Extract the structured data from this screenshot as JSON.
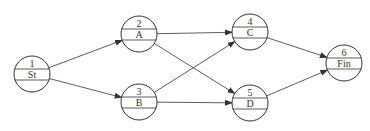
{
  "diagram": {
    "type": "activity-on-node network",
    "nodes": [
      {
        "id": "1",
        "label": "St"
      },
      {
        "id": "2",
        "label": "A"
      },
      {
        "id": "3",
        "label": "B"
      },
      {
        "id": "4",
        "label": "C"
      },
      {
        "id": "5",
        "label": "D"
      },
      {
        "id": "6",
        "label": "Fin"
      }
    ],
    "edges": [
      {
        "from": "1",
        "to": "2"
      },
      {
        "from": "1",
        "to": "3"
      },
      {
        "from": "2",
        "to": "4"
      },
      {
        "from": "2",
        "to": "5"
      },
      {
        "from": "3",
        "to": "4"
      },
      {
        "from": "3",
        "to": "5"
      },
      {
        "from": "4",
        "to": "6"
      },
      {
        "from": "5",
        "to": "6"
      }
    ],
    "colors": {
      "stroke": "#333333",
      "background": "#ffffff"
    }
  }
}
